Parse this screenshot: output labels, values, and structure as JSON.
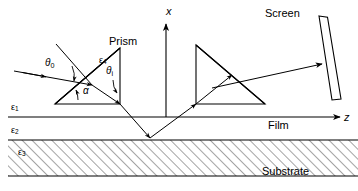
{
  "figure": {
    "background": "#ffffff",
    "stroke": "#000000",
    "width": 358,
    "height": 191
  },
  "axes": {
    "vertical": {
      "label": "x",
      "name": "x-axis",
      "x": 166,
      "y": 12
    },
    "horizontal": {
      "label": "z",
      "name": "z-axis",
      "x": 344,
      "y": 112
    }
  },
  "labels": {
    "prism": "Prism",
    "screen": "Screen",
    "film": "Film",
    "substrate": "Substrate"
  },
  "angles": {
    "theta0": {
      "sym": "θ",
      "sub": "0"
    },
    "thetai": {
      "sym": "θ",
      "sub": "i"
    },
    "alpha": {
      "sym": "α",
      "sub": ""
    }
  },
  "permittivities": [
    {
      "sym": "ε",
      "sub": "1",
      "region": "ambient-above-film"
    },
    {
      "sym": "ε",
      "sub": "2",
      "region": "film-layer"
    },
    {
      "sym": "ε",
      "sub": "3",
      "region": "substrate-layer"
    },
    {
      "sym": "ε",
      "sub": "4",
      "region": "prism-interior"
    }
  ],
  "colors": {
    "line": "#000000",
    "hatch": "#555555",
    "background": "#ffffff"
  },
  "geometry": {
    "left_prism": {
      "apex": [
        95,
        48
      ],
      "right_bottom": [
        120,
        100
      ],
      "left_bottom": [
        55,
        100
      ],
      "right_top": [
        120,
        48
      ]
    },
    "right_prism": {
      "apex_top_left": [
        196,
        45
      ],
      "left_bottom": [
        196,
        104
      ],
      "right_bottom": [
        265,
        104
      ]
    },
    "film_top_y": 117,
    "film_bottom_y": 140,
    "substrate_bottom_y": 176,
    "screen": {
      "top": [
        322,
        16
      ],
      "bottom": [
        336,
        100
      ],
      "width": 9,
      "tilt_deg": 9
    }
  }
}
